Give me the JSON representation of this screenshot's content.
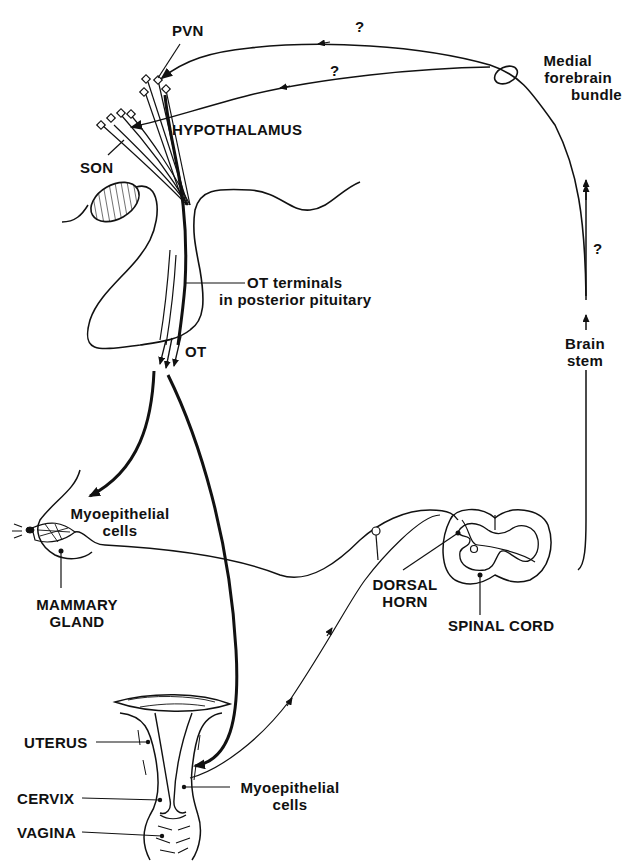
{
  "diagram": {
    "labels": {
      "pvn": "PVN",
      "hypothalamus": "HYPOTHALAMUS",
      "son": "SON",
      "ot_terminals_line1": "OT terminals",
      "ot_terminals_line2": "in posterior pituitary",
      "ot": "OT",
      "medial_forebrain_line1": "Medial",
      "medial_forebrain_line2": "forebrain",
      "medial_forebrain_line3": "bundle",
      "question_upper": "?",
      "question_lower": "?",
      "question_brainstem": "?",
      "brain_stem_line1": "Brain",
      "brain_stem_line2": "stem",
      "myoepithelial_breast_line1": "Myoepithelial",
      "myoepithelial_breast_line2": "cells",
      "mammary_line1": "MAMMARY",
      "mammary_line2": "GLAND",
      "dorsal_horn_line1": "DORSAL",
      "dorsal_horn_line2": "HORN",
      "spinal_cord": "SPINAL CORD",
      "uterus": "UTERUS",
      "cervix": "CERVIX",
      "vagina": "VAGINA",
      "myoepithelial_uterus_line1": "Myoepithelial",
      "myoepithelial_uterus_line2": "cells"
    },
    "colors": {
      "ink": "#111111",
      "background": "#ffffff"
    }
  }
}
